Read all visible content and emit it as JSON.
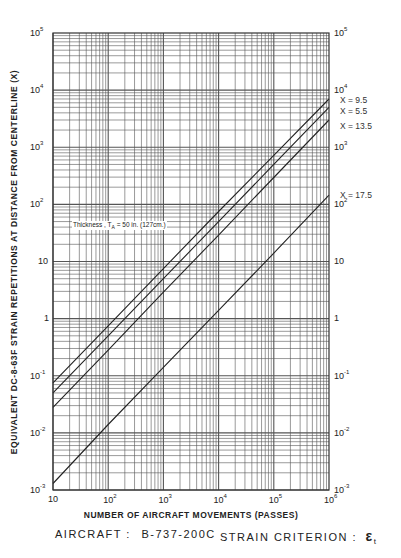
{
  "chart_data": {
    "type": "line",
    "scale": "log-log",
    "title": "",
    "xlabel": "NUMBER OF AIRCRAFT MOVEMENTS (PASSES)",
    "ylabel": "EQUIVALENT DC-8-63F STRAIN REPETITIONS AT DISTANCE FROM CENTERLINE (X)",
    "xlim": [
      10,
      1000000
    ],
    "ylim": [
      0.001,
      100000
    ],
    "x_ticks": [
      "10",
      "10^2",
      "10^3",
      "10^4",
      "10^5",
      "10^6"
    ],
    "y_ticks": [
      "10^-3",
      "10^-2",
      "10^-1",
      "1",
      "10",
      "10^2",
      "10^3",
      "10^4",
      "10^5"
    ],
    "grid": true,
    "annotation": "Thickness, T_A = 50 in. (127cm.)",
    "series": [
      {
        "name": "X = 9.5",
        "x": [
          10,
          100,
          1000,
          10000,
          100000,
          1000000
        ],
        "y": [
          0.075,
          0.75,
          7.5,
          75,
          720,
          7000
        ]
      },
      {
        "name": "X = 5.5",
        "x": [
          10,
          100,
          1000,
          10000,
          100000,
          1000000
        ],
        "y": [
          0.05,
          0.5,
          5,
          50,
          500,
          5000
        ]
      },
      {
        "name": "X = 13.5",
        "x": [
          10,
          100,
          1000,
          10000,
          100000,
          1000000
        ],
        "y": [
          0.028,
          0.28,
          2.9,
          29,
          295,
          3000
        ]
      },
      {
        "name": "X = 17.5",
        "x": [
          10,
          100,
          1000,
          10000,
          100000,
          1000000
        ],
        "y": [
          0.0013,
          0.014,
          0.14,
          1.4,
          14,
          145
        ]
      }
    ]
  },
  "labels": {
    "x_ticks": [
      {
        "base": "10",
        "exp": ""
      },
      {
        "base": "10",
        "exp": "2"
      },
      {
        "base": "10",
        "exp": "3"
      },
      {
        "base": "10",
        "exp": "4"
      },
      {
        "base": "10",
        "exp": "5"
      },
      {
        "base": "10",
        "exp": "6"
      }
    ],
    "y_ticks": [
      {
        "base": "10",
        "exp": "5"
      },
      {
        "base": "10",
        "exp": "4"
      },
      {
        "base": "10",
        "exp": "3"
      },
      {
        "base": "10",
        "exp": "2"
      },
      {
        "base": "10",
        "exp": ""
      },
      {
        "base": "1",
        "exp": ""
      },
      {
        "base": "10",
        "exp": "-1"
      },
      {
        "base": "10",
        "exp": "-2"
      },
      {
        "base": "10",
        "exp": "-3"
      }
    ],
    "curve_labels": [
      "X = 9.5",
      "X = 5.5",
      "X = 13.5",
      "X = 17.5"
    ],
    "annotation": "Thickness , T",
    "annotation_sub": "A",
    "annotation_rest": " = 50 in. (127cm.)",
    "xlabel": "NUMBER OF AIRCRAFT MOVEMENTS (PASSES)",
    "ylabel": "EQUIVALENT DC-8-63F STRAIN REPETITIONS AT DISTANCE FROM CENTERLINE (X)",
    "aircraft_label": "AIRCRAFT :",
    "aircraft_value": "B-737-200C",
    "criterion_label": "STRAIN CRITERION :",
    "criterion_value": "ε",
    "criterion_sub": "t"
  },
  "colors": {
    "grid": "#555555",
    "curve": "#222222",
    "background": "#ffffff"
  }
}
